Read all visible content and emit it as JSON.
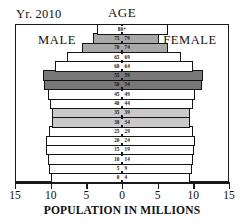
{
  "header": {
    "year_label": "Yr. 2010",
    "age_label": "AGE",
    "male_label": "MALE",
    "female_label": "FEMALE"
  },
  "axis": {
    "title": "POPULATION IN MILLIONS",
    "tick_labels": [
      "15",
      "10",
      "5",
      "0",
      "5",
      "10",
      "15"
    ],
    "tick_values": [
      -15,
      -10,
      -5,
      0,
      5,
      10,
      15
    ]
  },
  "colors": {
    "white": "#ffffff",
    "light_gray": "#c9c9c9",
    "medium_gray": "#a8a8a8",
    "dark_gray": "#787878",
    "outline": "#141414"
  },
  "chart_data": {
    "type": "bar",
    "subtype": "population-pyramid",
    "title": "Yr. 2010",
    "xlabel": "POPULATION IN MILLIONS",
    "ylabel": "AGE",
    "xlim": [
      -15,
      15
    ],
    "grid": false,
    "legend": "none",
    "units": "millions",
    "categories": [
      "0-4",
      "5-9",
      "10-14",
      "15-19",
      "20-24",
      "25-29",
      "30-34",
      "35-39",
      "40-44",
      "45-49",
      "50-54",
      "55-59",
      "60-64",
      "65-69",
      "70-74",
      "75-79",
      "80+"
    ],
    "series": [
      {
        "name": "MALE",
        "side": "left",
        "values": [
          9.9,
          10.3,
          10.4,
          10.6,
          10.7,
          10.3,
          9.8,
          9.8,
          10.1,
          10.4,
          11.0,
          11.1,
          9.4,
          7.7,
          5.6,
          4.0,
          3.5
        ]
      },
      {
        "name": "FEMALE",
        "side": "right",
        "values": [
          9.5,
          9.8,
          9.9,
          10.1,
          10.2,
          9.9,
          9.5,
          9.5,
          9.9,
          10.3,
          11.2,
          11.4,
          9.9,
          8.3,
          6.4,
          5.2,
          6.4
        ]
      }
    ],
    "band_shading": [
      {
        "bands": [
          "80+"
        ],
        "fill": "white"
      },
      {
        "bands": [
          "75-79",
          "70-74"
        ],
        "fill": "medium_gray"
      },
      {
        "bands": [
          "65-69",
          "60-64"
        ],
        "fill": "white"
      },
      {
        "bands": [
          "55-59",
          "50-54"
        ],
        "fill": "dark_gray"
      },
      {
        "bands": [
          "45-49",
          "40-44"
        ],
        "fill": "white"
      },
      {
        "bands": [
          "35-39",
          "30-34"
        ],
        "fill": "light_gray"
      },
      {
        "bands": [
          "25-29",
          "20-24",
          "15-19",
          "10-14",
          "5-9",
          "0-4"
        ],
        "fill": "white"
      }
    ]
  }
}
